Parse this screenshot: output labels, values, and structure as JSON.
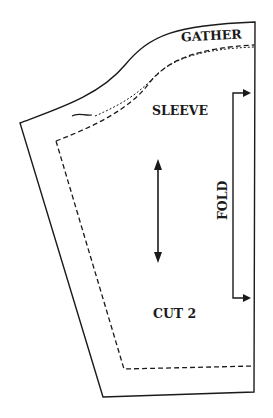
{
  "pattern_piece": {
    "name": "SLEEVE",
    "labels": {
      "top_edge": "GATHER",
      "piece_name": "SLEEVE",
      "fold": "FOLD",
      "cut_instruction": "CUT 2"
    },
    "markings": [
      "grainline-arrow",
      "fold-bracket",
      "notch",
      "seam-allowance-dashed-line",
      "gather-stitching"
    ],
    "colors": {
      "line": "#1a1a1a",
      "background": "#ffffff"
    }
  }
}
